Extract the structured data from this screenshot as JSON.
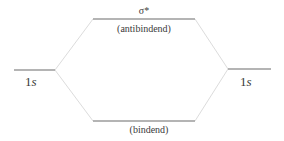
{
  "diagram": {
    "type": "molecular-orbital-energy-diagram",
    "levels": {
      "antibonding": {
        "symbol": "σ*",
        "caption": "(antibindend)"
      },
      "bonding": {
        "symbol": "",
        "caption": "(bindend)"
      },
      "left_atomic": {
        "number": "1",
        "orbital": "s"
      },
      "right_atomic": {
        "number": "1",
        "orbital": "s"
      }
    },
    "colors": {
      "level_line": "#6a6a6a",
      "connector_line": "#dcdcdc",
      "text": "#3a3a3a"
    }
  }
}
